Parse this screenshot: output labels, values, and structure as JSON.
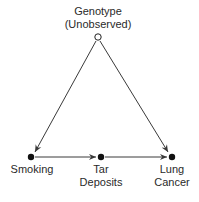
{
  "diagram": {
    "type": "causal-graph",
    "nodes": [
      {
        "id": "genotype",
        "label_line1": "Genotype",
        "label_line2": "(Unobserved)",
        "style": "open-circle"
      },
      {
        "id": "smoking",
        "label_line1": "Smoking",
        "label_line2": "",
        "style": "filled-circle"
      },
      {
        "id": "tar",
        "label_line1": "Tar",
        "label_line2": "Deposits",
        "style": "filled-circle"
      },
      {
        "id": "cancer",
        "label_line1": "Lung",
        "label_line2": "Cancer",
        "style": "filled-circle"
      }
    ],
    "edges": [
      {
        "from": "genotype",
        "to": "smoking"
      },
      {
        "from": "genotype",
        "to": "cancer"
      },
      {
        "from": "smoking",
        "to": "tar"
      },
      {
        "from": "tar",
        "to": "cancer"
      }
    ],
    "colors": {
      "line": "#3a3a3a",
      "node": "#111111",
      "text": "#2a2a2a"
    }
  }
}
